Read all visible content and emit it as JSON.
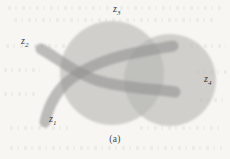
{
  "figure": {
    "caption": "(a)",
    "background_color": "#f7f6f3",
    "ink_color": "#3b3b3b",
    "region_fill_color": "#b5b5b3",
    "region_opacity": 0.62,
    "labels": [
      {
        "id": "z1",
        "base": "z",
        "subscript": "1",
        "text": "z₁"
      },
      {
        "id": "z2",
        "base": "z",
        "subscript": "2",
        "text": "z₂"
      },
      {
        "id": "z3",
        "base": "z",
        "subscript": "3",
        "text": "z₃"
      },
      {
        "id": "z4",
        "base": "z",
        "subscript": "4",
        "text": "z₄"
      }
    ],
    "shapes": [
      {
        "id": "z3",
        "kind": "circle",
        "label": "z3",
        "cx": 112,
        "cy": 73,
        "r": 52,
        "fill": "#b5b5b3",
        "opacity": 0.62
      },
      {
        "id": "z4",
        "kind": "circle",
        "label": "z4",
        "cx": 170,
        "cy": 80,
        "r": 46,
        "fill": "#b5b5b3",
        "opacity": 0.62
      },
      {
        "id": "z2",
        "kind": "tube",
        "label": "z2",
        "path": "M41,49 C55,56 72,72 96,80 C122,89 150,89 174,92",
        "stroke": "#9a9a98",
        "stroke_width": 11,
        "opacity": 0.62
      },
      {
        "id": "z1",
        "kind": "tube",
        "label": "z1",
        "path": "M45,121 C50,104 58,88 76,76 C98,61 126,55 149,50 C160,48 168,47 172,46",
        "stroke": "#9a9a98",
        "stroke_width": 11,
        "opacity": 0.62
      }
    ]
  }
}
